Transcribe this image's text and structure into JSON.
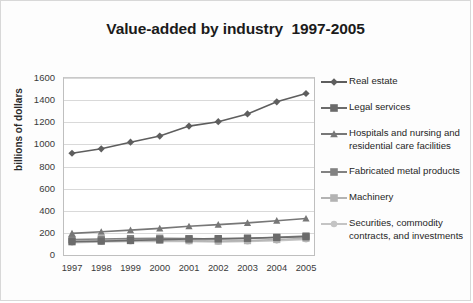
{
  "chart_data": {
    "type": "line",
    "title": "Value-added by industry  1997-2005",
    "xlabel": "",
    "ylabel": "billions of dollars",
    "categories": [
      "1997",
      "1998",
      "1999",
      "2000",
      "2001",
      "2002",
      "2003",
      "2004",
      "2005"
    ],
    "ylim": [
      0,
      1600
    ],
    "ytick_step": 200,
    "yticks": [
      "1600",
      "1400",
      "1200",
      "1000",
      "800",
      "600",
      "400",
      "200",
      "0"
    ],
    "grid": true,
    "legend_position": "right",
    "series": [
      {
        "name": "Real estate",
        "marker": "diamond",
        "color": "#5e5e5e",
        "values": [
          920,
          960,
          1020,
          1075,
          1165,
          1205,
          1275,
          1385,
          1460
        ]
      },
      {
        "name": "Legal services",
        "marker": "square",
        "color": "#6b6b6b",
        "values": [
          120,
          125,
          132,
          138,
          145,
          148,
          152,
          158,
          165
        ]
      },
      {
        "name": "Hospitals and nursing and residential care facilities",
        "marker": "triangle",
        "color": "#777777",
        "values": [
          195,
          210,
          225,
          240,
          260,
          275,
          290,
          310,
          330
        ]
      },
      {
        "name": "Fabricated metal products",
        "marker": "square",
        "color": "#828282",
        "values": [
          140,
          145,
          148,
          152,
          148,
          145,
          150,
          160,
          172
        ]
      },
      {
        "name": "Machinery",
        "marker": "square",
        "color": "#b3b3b3",
        "values": [
          128,
          132,
          130,
          134,
          130,
          126,
          130,
          140,
          152
        ]
      },
      {
        "name": "Securities, commodity contracts, and investments",
        "marker": "circle",
        "color": "#c4c4c4",
        "values": [
          112,
          118,
          122,
          126,
          122,
          118,
          122,
          130,
          140
        ]
      }
    ]
  }
}
